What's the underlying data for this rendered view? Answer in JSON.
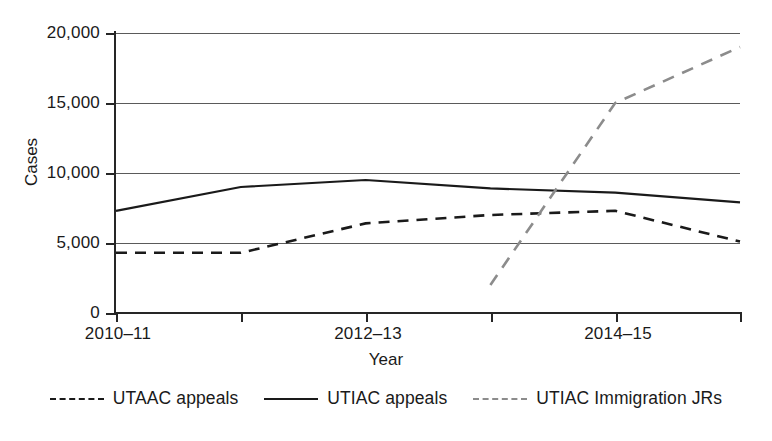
{
  "chart_data": {
    "type": "line",
    "title": "",
    "xlabel": "Year",
    "ylabel": "Cases",
    "x": [
      "2010–11",
      "2011–12",
      "2012–13",
      "2013–14",
      "2014–15",
      "2015–16"
    ],
    "xtick_labels_shown": [
      "2010–11",
      "",
      "2012–13",
      "",
      "2014–15",
      ""
    ],
    "xlim_categories": 6,
    "ylim": [
      0,
      20000
    ],
    "ytick_labels": [
      "0",
      "5,000",
      "10,000",
      "15,000",
      "20,000"
    ],
    "ytick_values": [
      0,
      5000,
      10000,
      15000,
      20000
    ],
    "grid": true,
    "grid_axis": "y",
    "legend_position": "bottom",
    "series": [
      {
        "name": "UTAAC appeals",
        "style": "dashed",
        "color": "#1a1a1a",
        "values": [
          4300,
          4300,
          6400,
          7000,
          7300,
          5100
        ]
      },
      {
        "name": "UTIAC appeals",
        "style": "solid",
        "color": "#1a1a1a",
        "values": [
          7300,
          9000,
          9500,
          8900,
          8600,
          7900
        ]
      },
      {
        "name": "UTIAC Immigration JRs",
        "style": "dashed",
        "color": "#8c8c8c",
        "values": [
          null,
          null,
          null,
          2000,
          15000,
          19000
        ]
      }
    ]
  },
  "axes": {
    "y_title": "Cases",
    "x_title": "Year",
    "y_ticks": [
      {
        "label": "20,000",
        "value": 20000
      },
      {
        "label": "15,000",
        "value": 15000
      },
      {
        "label": "10,000",
        "value": 10000
      },
      {
        "label": "5,000",
        "value": 5000
      },
      {
        "label": "0",
        "value": 0
      }
    ],
    "x_ticks": [
      {
        "label": "2010–11",
        "index": 0
      },
      {
        "label": "",
        "index": 1
      },
      {
        "label": "2012–13",
        "index": 2
      },
      {
        "label": "",
        "index": 3
      },
      {
        "label": "2014–15",
        "index": 4
      },
      {
        "label": "",
        "index": 5
      }
    ]
  },
  "legend": {
    "items": [
      {
        "label": "UTAAC appeals",
        "style": "dashed",
        "color": "#1a1a1a"
      },
      {
        "label": "UTIAC appeals",
        "style": "solid",
        "color": "#1a1a1a"
      },
      {
        "label": "UTIAC Immigration JRs",
        "style": "dashed",
        "color": "#8c8c8c"
      }
    ]
  }
}
